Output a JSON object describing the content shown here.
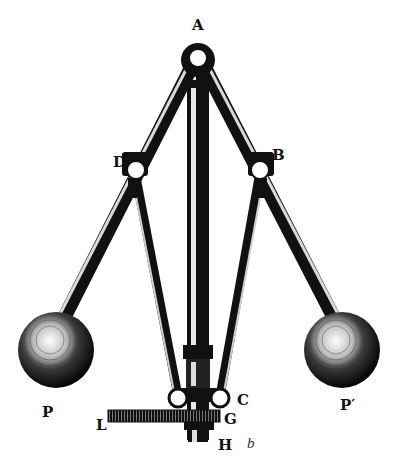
{
  "figure": {
    "labels": {
      "A": "A",
      "B": "B",
      "D": "D",
      "P": "P",
      "P_prime": "P′",
      "L": "L",
      "C": "C",
      "G": "G",
      "H": "H",
      "b": "b"
    },
    "colors": {
      "ink": "#111111",
      "paper": "#ffffff",
      "highlight": "#f2f2f2"
    }
  }
}
